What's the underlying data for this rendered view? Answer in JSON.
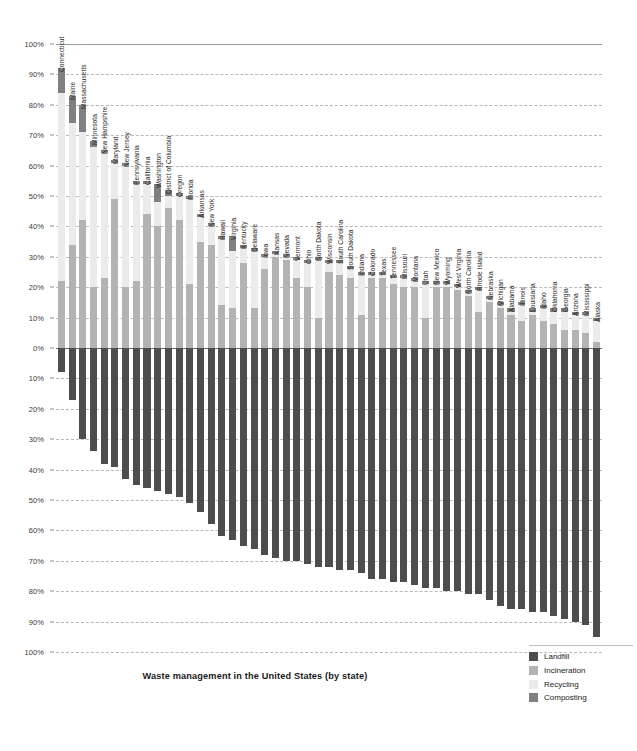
{
  "title": "Waste management in the United States (by state)",
  "axis": {
    "y_ticks_top": [
      "100%",
      "90%",
      "80%",
      "70%",
      "60%",
      "50%",
      "40%",
      "30%",
      "20%",
      "10%",
      "0%"
    ],
    "y_ticks_bottom": [
      "10%",
      "20%",
      "30%",
      "40%",
      "50%",
      "60%",
      "70%",
      "80%",
      "90%",
      "100%"
    ]
  },
  "legend": {
    "items": [
      {
        "label": "Landfill",
        "color": "#4d4d4d",
        "key": "landfill"
      },
      {
        "label": "Incineration",
        "color": "#b3b3b3",
        "key": "incineration"
      },
      {
        "label": "Recycling",
        "color": "#ebebeb",
        "key": "recycling"
      },
      {
        "label": "Composting",
        "color": "#808080",
        "key": "composting"
      }
    ]
  },
  "chart_data": {
    "type": "bar",
    "subtype": "diverging-stacked-column",
    "title": "Waste management in the United States (by state)",
    "xlabel": "",
    "ylabel": "",
    "ylim": [
      -100,
      100
    ],
    "grid": true,
    "legend_position": "bottom-right",
    "categories": [
      "Connecticut",
      "Maine",
      "Massachusetts",
      "Minnesota",
      "New Hampshire",
      "Maryland",
      "New Jersey",
      "Pennsylvania",
      "California",
      "Washington",
      "District of Columbia",
      "Oregon",
      "Florida",
      "Arkansas",
      "New York",
      "Hawaii",
      "Virginia",
      "Kentucky",
      "Delaware",
      "Iowa",
      "Kansas",
      "Nevada",
      "Vermont",
      "Ohio",
      "North Dakota",
      "Wisconsin",
      "South Carolina",
      "South Dakota",
      "Indiana",
      "Colorado",
      "Texas",
      "Tennessee",
      "Missouri",
      "Montana",
      "Utah",
      "New Mexico",
      "Wyoming",
      "West Virginia",
      "North Carolina",
      "Rhode Island",
      "Nebraska",
      "Michigan",
      "Alabama",
      "Illinois",
      "Louisiana",
      "Idaho",
      "Oklahoma",
      "Georgia",
      "Arizona",
      "Mississippi",
      "Alaska"
    ],
    "series": [
      {
        "name": "Incineration",
        "key": "incineration",
        "color": "#b3b3b3",
        "values": [
          22,
          34,
          42,
          20,
          23,
          49,
          20,
          22,
          44,
          40,
          46,
          42,
          21,
          35,
          34,
          14,
          13,
          28,
          13,
          26,
          30,
          29,
          23,
          20,
          10,
          25,
          24,
          23,
          11,
          23,
          23,
          21,
          20,
          20,
          10,
          20,
          20,
          19,
          17,
          12,
          15,
          13,
          11,
          9,
          11,
          9,
          8,
          6,
          6,
          5,
          2
        ]
      },
      {
        "name": "Recycling",
        "key": "recycling",
        "color": "#ebebeb",
        "values": [
          62,
          40,
          29,
          46,
          41,
          12,
          40,
          32,
          10,
          8,
          4,
          8,
          28,
          8,
          6,
          22,
          19,
          5,
          19,
          4,
          1,
          1,
          6,
          8,
          19,
          3,
          4,
          3,
          13,
          1,
          1,
          2,
          3,
          2,
          11,
          1,
          1,
          1,
          1,
          7,
          1,
          1,
          1,
          5,
          1,
          4,
          4,
          6,
          5,
          6,
          7
        ]
      },
      {
        "name": "Composting",
        "key": "composting",
        "color": "#808080",
        "values": [
          8,
          9,
          9,
          2,
          1,
          1,
          1,
          1,
          1,
          6,
          2,
          1,
          1,
          1,
          1,
          1,
          5,
          1,
          1,
          1,
          1,
          1,
          1,
          1,
          1,
          1,
          1,
          1,
          1,
          1,
          1,
          1,
          1,
          1,
          1,
          1,
          1,
          1,
          1,
          1,
          1,
          1,
          1,
          1,
          1,
          1,
          1,
          1,
          1,
          1,
          1
        ]
      },
      {
        "name": "Landfill",
        "key": "landfill",
        "color": "#4d4d4d",
        "values": [
          -8,
          -17,
          -30,
          -34,
          -38,
          -39,
          -43,
          -45,
          -46,
          -47,
          -48,
          -49,
          -51,
          -54,
          -58,
          -62,
          -63,
          -65,
          -66,
          -68,
          -69,
          -70,
          -70,
          -71,
          -72,
          -72,
          -73,
          -73,
          -74,
          -76,
          -76,
          -77,
          -77,
          -78,
          -79,
          -79,
          -80,
          -80,
          -81,
          -81,
          -83,
          -85,
          -86,
          -86,
          -87,
          -87,
          -88,
          -89,
          -90,
          -91,
          -95
        ]
      }
    ]
  }
}
